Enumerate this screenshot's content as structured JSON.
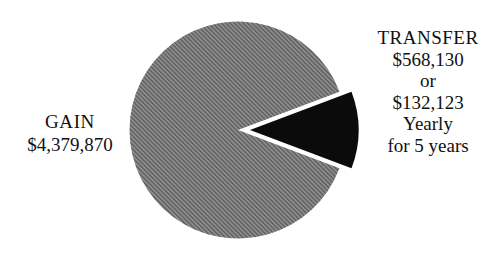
{
  "chart_data": {
    "type": "pie",
    "title": "",
    "subtitle": "",
    "xlabel": "",
    "ylabel": "",
    "legend_position": "none",
    "grid": false,
    "categories": [
      "GAIN",
      "TRANSFER"
    ],
    "values": [
      4379870,
      568130
    ],
    "value_labels": [
      "$4,379,870",
      "$568,130"
    ],
    "total": 4948000,
    "percentages": [
      88.52,
      11.48
    ],
    "slices": [
      {
        "name": "GAIN",
        "label": "GAIN",
        "value": 4379870,
        "value_label": "$4,379,870",
        "percent": 88.52,
        "start_angle_deg": 20.7,
        "end_angle_deg": 339.3,
        "fill": "hatched-gray",
        "color": "#8a8a8a",
        "hatch_color": "#4f4f4f",
        "exploded": false
      },
      {
        "name": "TRANSFER",
        "label": "TRANSFER",
        "value": 568130,
        "value_label": "$568,130",
        "percent": 11.48,
        "start_angle_deg": -20.7,
        "end_angle_deg": 20.7,
        "fill": "solid-black",
        "color": "#0b0b0b",
        "exploded": true
      }
    ],
    "annotations": [
      "TRANSFER",
      "$568,130",
      "or",
      "$132,123",
      "Yearly",
      "for 5 years",
      "GAIN",
      "$4,379,870"
    ]
  },
  "labels": {
    "gain": {
      "title": "GAIN",
      "value": "$4,379,870"
    },
    "transfer": {
      "title": "TRANSFER",
      "amount": "$568,130",
      "conjunction": "or",
      "yearly_amount": "$132,123",
      "yearly_word": "Yearly",
      "duration": "for 5 years"
    }
  },
  "colors": {
    "background": "#ffffff",
    "gain_slice": "#8a8a8a",
    "gain_hatch": "#4f4f4f",
    "transfer_slice": "#0b0b0b",
    "text": "#111111"
  }
}
